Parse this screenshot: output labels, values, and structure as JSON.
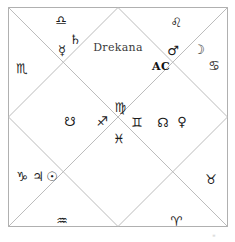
{
  "chart": {
    "title": "Drekana",
    "ascendant_label": "AC",
    "style": "north-indian-square-diamond",
    "line_color": "#b9b9b9",
    "border_color": "#b0b0b0",
    "background": "#ffffff",
    "geometry": {
      "left": 8,
      "top": 7,
      "size": 220,
      "center_x": 118,
      "center_y": 117
    },
    "title_position": {
      "x": 118,
      "y": 47
    },
    "ascendant_position": {
      "x": 161,
      "y": 66
    }
  },
  "signs": [
    {
      "name": "libra",
      "glyph": "♎",
      "x": 61,
      "y": 20
    },
    {
      "name": "leo",
      "glyph": "♌",
      "x": 176,
      "y": 22
    },
    {
      "name": "scorpio",
      "glyph": "♏",
      "x": 22,
      "y": 68
    },
    {
      "name": "cancer",
      "glyph": "♋",
      "x": 214,
      "y": 65
    },
    {
      "name": "virgo",
      "glyph": "♍",
      "x": 120,
      "y": 107
    },
    {
      "name": "sagittarius",
      "glyph": "♐",
      "x": 102,
      "y": 121
    },
    {
      "name": "gemini",
      "glyph": "♊",
      "x": 137,
      "y": 122
    },
    {
      "name": "pisces",
      "glyph": "♓",
      "x": 119,
      "y": 138
    },
    {
      "name": "capricorn",
      "glyph": "♑",
      "x": 22,
      "y": 176
    },
    {
      "name": "taurus",
      "glyph": "♉",
      "x": 211,
      "y": 179
    },
    {
      "name": "aquarius",
      "glyph": "♒",
      "x": 62,
      "y": 220
    },
    {
      "name": "aries",
      "glyph": "♈",
      "x": 176,
      "y": 221
    }
  ],
  "planets": [
    {
      "name": "saturn",
      "glyph": "♄",
      "x": 75,
      "y": 39
    },
    {
      "name": "mercury",
      "glyph": "☿",
      "x": 62,
      "y": 50
    },
    {
      "name": "mars",
      "glyph": "♂",
      "x": 173,
      "y": 50
    },
    {
      "name": "moon",
      "glyph": "☽",
      "x": 199,
      "y": 49
    },
    {
      "name": "ketu",
      "glyph": "☋",
      "x": 70,
      "y": 121
    },
    {
      "name": "rahu",
      "glyph": "☊",
      "x": 163,
      "y": 122
    },
    {
      "name": "venus",
      "glyph": "♀",
      "x": 182,
      "y": 121
    },
    {
      "name": "jupiter",
      "glyph": "♃",
      "x": 38,
      "y": 176
    },
    {
      "name": "sun",
      "glyph": "☉",
      "x": 52,
      "y": 176
    }
  ],
  "corner_mark": {
    "text": "≡",
    "x": 214,
    "y": 235
  }
}
